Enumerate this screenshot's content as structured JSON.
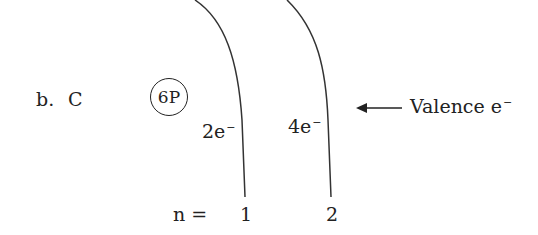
{
  "diagram": {
    "label": "b.",
    "element": "C",
    "nucleus": "6P",
    "shells": [
      {
        "n": "1",
        "electrons": "2e",
        "charge": "−"
      },
      {
        "n": "2",
        "electrons": "4e",
        "charge": "−"
      }
    ],
    "n_label": "n =",
    "annotation": {
      "text": "Valence e",
      "charge": "−"
    }
  }
}
